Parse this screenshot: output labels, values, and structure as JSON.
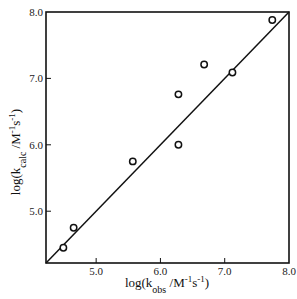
{
  "chart_data": {
    "type": "scatter",
    "title": "",
    "xlabel": "log(k_obs /M-1s-1)",
    "ylabel": "log(k_calc /M-1s-1)",
    "xlabel_parts": {
      "pre": "log(k",
      "sub": "obs",
      "mid": " /M",
      "sup1": "-1",
      "s": "s",
      "sup2": "-1",
      "post": ")"
    },
    "ylabel_parts": {
      "pre": "log(k",
      "sub": "calc",
      "mid": " /M",
      "sup1": "-1",
      "s": "s",
      "sup2": "-1",
      "post": ")"
    },
    "xlim": [
      4.22,
      8.0
    ],
    "ylim": [
      4.22,
      8.0
    ],
    "xticks": [
      5.0,
      6.0,
      7.0,
      8.0
    ],
    "yticks": [
      5.0,
      6.0,
      7.0,
      8.0
    ],
    "xtick_labels": [
      "5.0",
      "6.0",
      "7.0",
      "8.0"
    ],
    "ytick_labels": [
      "5.0",
      "6.0",
      "7.0",
      "8.0"
    ],
    "grid": false,
    "legend": null,
    "series": [
      {
        "name": "data",
        "marker": "open-circle",
        "points": [
          {
            "x": 4.49,
            "y": 4.45
          },
          {
            "x": 4.65,
            "y": 4.75
          },
          {
            "x": 5.57,
            "y": 5.75
          },
          {
            "x": 6.28,
            "y": 6.0
          },
          {
            "x": 6.28,
            "y": 6.76
          },
          {
            "x": 6.68,
            "y": 7.21
          },
          {
            "x": 7.12,
            "y": 7.09
          },
          {
            "x": 7.74,
            "y": 7.88
          }
        ]
      },
      {
        "name": "fit line (y = x)",
        "type": "line",
        "points": [
          {
            "x": 4.22,
            "y": 4.22
          },
          {
            "x": 8.0,
            "y": 8.0
          }
        ]
      }
    ]
  },
  "colors": {
    "ink": "#111111",
    "background": "#ffffff"
  }
}
